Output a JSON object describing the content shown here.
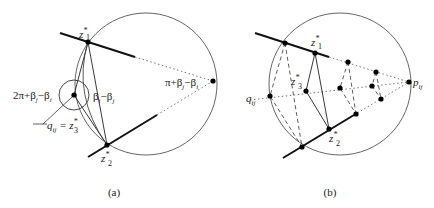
{
  "panels": [
    {
      "caption": "(a)",
      "labels": {
        "z1": "z",
        "z1_sup": "*",
        "z1_sub": "1",
        "z2": "z",
        "z2_sup": "*",
        "z2_sub": "2",
        "p": "p",
        "p_sub": "ij",
        "angle_outer": "2π+β",
        "angle_outer_j": "j",
        "angle_outer_rest": "−β",
        "angle_outer_i": "i",
        "angle_inner": "β",
        "angle_inner_i": "i",
        "angle_inner_rest": "−β",
        "angle_inner_j": "j",
        "angle_p": "π+β",
        "angle_p_j": "j",
        "angle_p_rest": "−β",
        "angle_p_i": "i",
        "q": "q",
        "q_sub": "ij",
        "q_eq": " = z",
        "q_sup": "*",
        "q_eq_sub": "3"
      }
    },
    {
      "caption": "(b)",
      "labels": {
        "z1": "z",
        "z1_sup": "*",
        "z1_sub": "1",
        "z2": "z",
        "z2_sup": "*",
        "z2_sub": "2",
        "z3": "z",
        "z3_sup": "*",
        "z3_sub": "3",
        "p": "p",
        "p_sub": "ij",
        "q": "q",
        "q_sub": "ij"
      }
    }
  ],
  "colors": {
    "stroke": "#222222",
    "circle": "#555555",
    "dots": "#000000"
  }
}
